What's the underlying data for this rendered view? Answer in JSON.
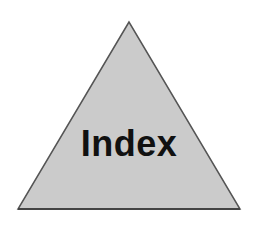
{
  "diagram": {
    "shape": "triangle",
    "label": "Index",
    "colors": {
      "fill": "#cbcbcb",
      "stroke": "#555555",
      "text": "#111111",
      "background": "#ffffff"
    }
  }
}
